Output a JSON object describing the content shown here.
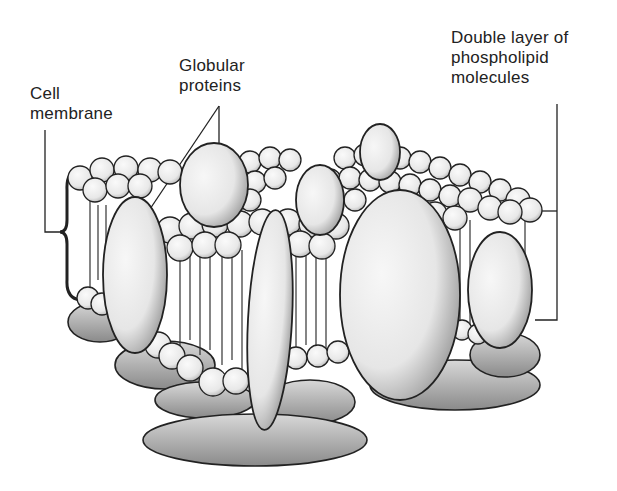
{
  "diagram": {
    "labels": {
      "cell_membrane": [
        "Cell",
        "membrane"
      ],
      "globular_proteins": [
        "Globular",
        "proteins"
      ],
      "phospholipid_bilayer": [
        "Double layer of",
        "phospholipid",
        "molecules"
      ]
    },
    "colors": {
      "ink": "#222222",
      "fill": "#f2f2f2",
      "shade": "#9a9a9a",
      "background": "#ffffff"
    }
  }
}
